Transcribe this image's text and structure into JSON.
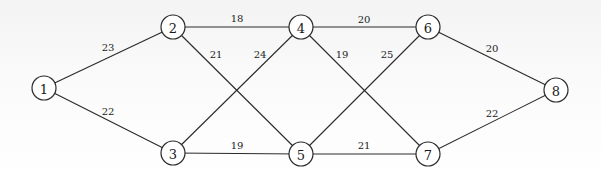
{
  "diagram": {
    "type": "weighted-graph",
    "nodes": [
      {
        "id": "1",
        "label": "1",
        "x": 44,
        "y": 88
      },
      {
        "id": "2",
        "label": "2",
        "x": 173,
        "y": 27
      },
      {
        "id": "3",
        "label": "3",
        "x": 173,
        "y": 153
      },
      {
        "id": "4",
        "label": "4",
        "x": 301,
        "y": 27
      },
      {
        "id": "5",
        "label": "5",
        "x": 301,
        "y": 154
      },
      {
        "id": "6",
        "label": "6",
        "x": 428,
        "y": 27
      },
      {
        "id": "7",
        "label": "7",
        "x": 428,
        "y": 154
      },
      {
        "id": "8",
        "label": "8",
        "x": 556,
        "y": 90
      }
    ],
    "edges": [
      {
        "from": "1",
        "to": "2",
        "weight": "23",
        "lx": 108,
        "ly": 51
      },
      {
        "from": "1",
        "to": "3",
        "weight": "22",
        "lx": 108,
        "ly": 115
      },
      {
        "from": "2",
        "to": "4",
        "weight": "18",
        "lx": 237,
        "ly": 22
      },
      {
        "from": "2",
        "to": "5",
        "weight": "21",
        "lx": 216,
        "ly": 58
      },
      {
        "from": "3",
        "to": "4",
        "weight": "24",
        "lx": 260,
        "ly": 58
      },
      {
        "from": "3",
        "to": "5",
        "weight": "19",
        "lx": 237,
        "ly": 149
      },
      {
        "from": "4",
        "to": "6",
        "weight": "20",
        "lx": 364,
        "ly": 23
      },
      {
        "from": "4",
        "to": "7",
        "weight": "19",
        "lx": 342,
        "ly": 58
      },
      {
        "from": "5",
        "to": "6",
        "weight": "25",
        "lx": 387,
        "ly": 58
      },
      {
        "from": "5",
        "to": "7",
        "weight": "21",
        "lx": 364,
        "ly": 149
      },
      {
        "from": "6",
        "to": "8",
        "weight": "20",
        "lx": 492,
        "ly": 52
      },
      {
        "from": "7",
        "to": "8",
        "weight": "22",
        "lx": 492,
        "ly": 117
      }
    ]
  }
}
